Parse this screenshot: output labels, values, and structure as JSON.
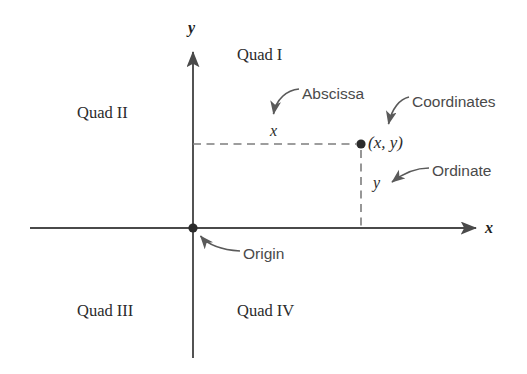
{
  "figure": {
    "type": "cartesian-coordinate-plane-diagram",
    "background_color": "#ffffff",
    "axis_color": "#4a4a4a",
    "dash_color": "#7d7d7d",
    "annotation_color": "#4a4a4a",
    "text_color": "#2b2b2b"
  },
  "axes": {
    "x_axis_label": "x",
    "y_axis_label": "y",
    "x_axis_start_px": 30,
    "x_axis_end_px": 482,
    "y_axis_top_px": 46,
    "y_axis_bottom_px": 358,
    "origin_px": {
      "x": 193,
      "y": 228
    }
  },
  "quadrants": [
    {
      "id": "quad-1",
      "label": "Quad I",
      "x": 237,
      "y": 47
    },
    {
      "id": "quad-2",
      "label": "Quad II",
      "x": 77,
      "y": 105
    },
    {
      "id": "quad-3",
      "label": "Quad III",
      "x": 77,
      "y": 303
    },
    {
      "id": "quad-4",
      "label": "Quad IV",
      "x": 237,
      "y": 303
    }
  ],
  "point": {
    "label": "(x, y)",
    "x_px": 361,
    "y_px": 144,
    "dot_radius_px": 4.5
  },
  "origin": {
    "label": "Origin",
    "dot_radius_px": 4.5
  },
  "annotations": [
    {
      "id": "abscissa",
      "label": "Abscissa",
      "x": 302,
      "y": 86
    },
    {
      "id": "coordinates",
      "label": "Coordinates",
      "x": 412,
      "y": 94
    },
    {
      "id": "ordinate",
      "label": "Ordinate",
      "x": 432,
      "y": 163
    },
    {
      "id": "origin",
      "label": "Origin",
      "x": 243,
      "y": 246
    }
  ],
  "variables": {
    "abscissa_var": "x",
    "ordinate_var": "y",
    "abscissa_var_px": {
      "x": 270,
      "y": 123
    },
    "ordinate_var_px": {
      "x": 373,
      "y": 175
    }
  },
  "dashed_lines": [
    {
      "id": "abscissa-guide",
      "from": [
        193,
        144
      ],
      "to": [
        357,
        144
      ],
      "orientation": "horizontal"
    },
    {
      "id": "ordinate-guide",
      "from": [
        361,
        150
      ],
      "to": [
        361,
        228
      ],
      "orientation": "vertical"
    }
  ]
}
